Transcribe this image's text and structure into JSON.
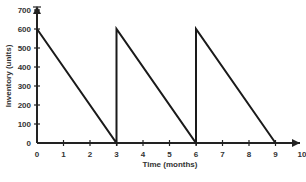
{
  "chart_data": {
    "type": "line",
    "title": "",
    "xlabel": "Time (months)",
    "ylabel": "Inventory (units)",
    "xlim": [
      0,
      10
    ],
    "ylim": [
      0,
      700
    ],
    "x_ticks": [
      0,
      1,
      2,
      3,
      4,
      5,
      6,
      7,
      8,
      9,
      10
    ],
    "y_ticks": [
      0,
      100,
      200,
      300,
      400,
      500,
      600,
      700
    ],
    "grid": false,
    "legend": null,
    "series": [
      {
        "name": "Inventory",
        "x": [
          0,
          3,
          3,
          6,
          6,
          9
        ],
        "y": [
          600,
          0,
          600,
          0,
          600,
          0
        ]
      }
    ]
  }
}
